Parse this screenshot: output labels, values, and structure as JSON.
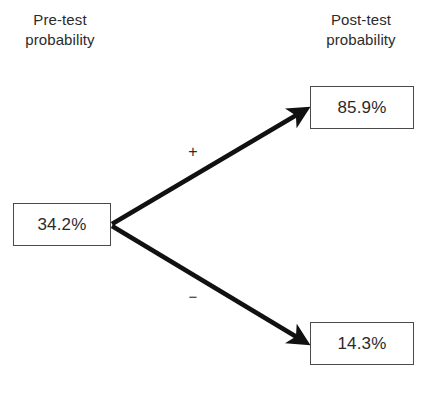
{
  "diagram": {
    "type": "probability-tree",
    "headers": {
      "left": "Pre-test\nprobability",
      "right": "Post-test\nprobability"
    },
    "nodes": {
      "pretest": {
        "label": "34.2%",
        "value": 34.2
      },
      "post_positive": {
        "label": "85.9%",
        "value": 85.9
      },
      "post_negative": {
        "label": "14.3%",
        "value": 14.3
      }
    },
    "branches": {
      "positive": {
        "label": "+",
        "from": "pretest",
        "to": "post_positive"
      },
      "negative": {
        "label": "−",
        "from": "pretest",
        "to": "post_negative"
      }
    },
    "caption_partial": "",
    "colors": {
      "arrow": "#111111",
      "box_border": "#4a4a4a",
      "text": "#2b2b2b",
      "background": "#ffffff"
    }
  }
}
